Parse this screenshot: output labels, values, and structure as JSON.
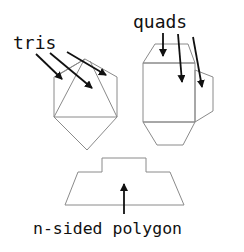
{
  "diagram": {
    "labels": {
      "tris": "tris",
      "quads": "quads",
      "polygon": "n-sided polygon"
    },
    "colors": {
      "outline": "#8a8a8a",
      "arrow": "#111111",
      "text": "#111111",
      "background": "#ffffff"
    },
    "shapes": {
      "triangulated_hexagon": {
        "outline": [
          [
            85,
            59
          ],
          [
            117,
            77
          ],
          [
            117,
            117
          ],
          [
            87,
            150
          ],
          [
            54,
            117
          ],
          [
            54,
            77
          ]
        ],
        "internal_edges": [
          [
            [
              54,
              117
            ],
            [
              117,
              117
            ]
          ],
          [
            [
              54,
              117
            ],
            [
              84,
              60
            ]
          ],
          [
            [
              117,
              117
            ],
            [
              90,
              61
            ]
          ],
          [
            [
              60,
              74
            ],
            [
              85,
              59
            ]
          ]
        ]
      },
      "quad_mesh": {
        "top": [
          [
            143,
            63
          ],
          [
            155,
            44
          ],
          [
            188,
            44
          ],
          [
            195,
            63
          ]
        ],
        "center": [
          [
            143,
            63
          ],
          [
            195,
            63
          ],
          [
            195,
            122
          ],
          [
            143,
            122
          ]
        ],
        "right": [
          [
            195,
            70
          ],
          [
            213,
            77
          ],
          [
            213,
            111
          ],
          [
            195,
            122
          ]
        ],
        "bottom": [
          [
            143,
            122
          ],
          [
            157,
            145
          ],
          [
            183,
            145
          ],
          [
            195,
            122
          ]
        ]
      },
      "n_sided_polygon": [
        [
          65,
          205
        ],
        [
          78,
          172
        ],
        [
          102,
          172
        ],
        [
          102,
          158
        ],
        [
          146,
          158
        ],
        [
          146,
          172
        ],
        [
          170,
          172
        ],
        [
          184,
          205
        ]
      ]
    },
    "arrows": {
      "tris": [
        [
          [
            36,
            54
          ],
          [
            62,
            79
          ]
        ],
        [
          [
            50,
            53
          ],
          [
            92,
            88
          ]
        ],
        [
          [
            67,
            52
          ],
          [
            106,
            75
          ]
        ]
      ],
      "quads": [
        [
          [
            163,
            33
          ],
          [
            163,
            56
          ]
        ],
        [
          [
            178,
            34
          ],
          [
            182,
            82
          ]
        ],
        [
          [
            193,
            37
          ],
          [
            202,
            87
          ]
        ]
      ],
      "polygon": [
        [
          [
            124,
            214
          ],
          [
            124,
            184
          ]
        ]
      ]
    }
  }
}
